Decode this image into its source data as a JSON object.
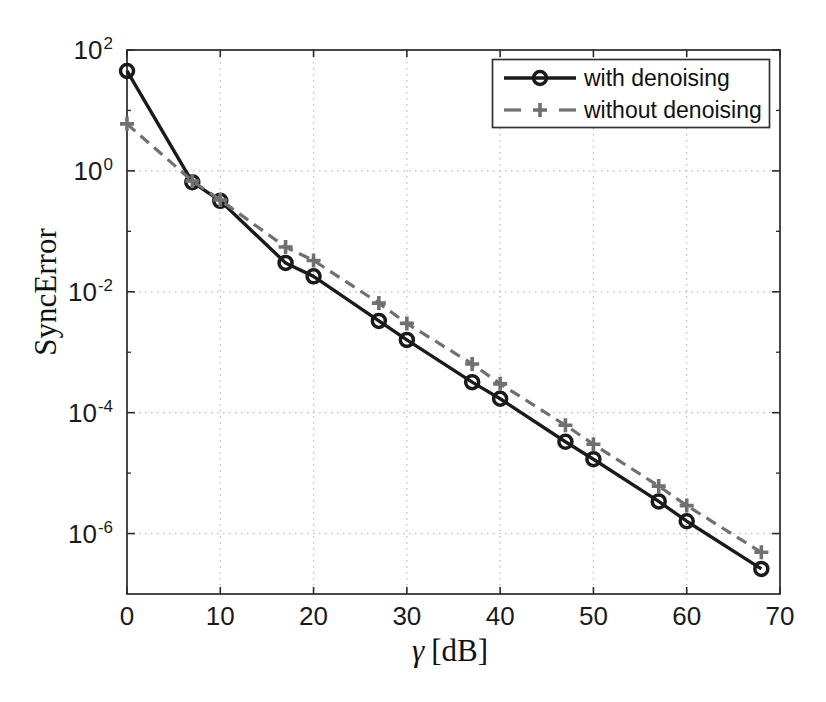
{
  "figure": {
    "background": "#ffffff",
    "axis_color": "#2a2a2a",
    "grid_color": "#bdbdbd",
    "text_color": "#1a1a1a"
  },
  "chart_data": {
    "type": "line",
    "title": "",
    "xlabel": "γ [dB]",
    "xlabel_symbol": "γ",
    "xlabel_unit": "[dB]",
    "ylabel": "SyncError",
    "x_axis": {
      "min": 0,
      "max": 70,
      "ticks": [
        0,
        10,
        20,
        30,
        40,
        50,
        60,
        70
      ]
    },
    "y_axis": {
      "scale": "log",
      "tick_base": "10",
      "min_exponent": -7,
      "max_exponent": 2,
      "labeled_tick_exponents": [
        2,
        0,
        -2,
        -4,
        -6
      ],
      "minor_tick_exponents": [
        1,
        -1,
        -3,
        -5
      ]
    },
    "grid": {
      "style": "dotted",
      "vertical_every_dB": 10,
      "horizontal_every_decades": 2
    },
    "legend": {
      "position": "top-right",
      "border_color": "#333333",
      "background": "#ffffff"
    },
    "x": [
      0,
      7,
      10,
      17,
      20,
      27,
      30,
      37,
      40,
      47,
      50,
      57,
      60,
      68
    ],
    "series": [
      {
        "name": "with denoising",
        "line": "solid",
        "marker": "circle",
        "color": "#1a1a1a",
        "values": [
          45,
          0.65,
          0.32,
          0.03,
          0.018,
          0.0033,
          0.0016,
          0.00032,
          0.00017,
          3.3e-05,
          1.7e-05,
          3.4e-06,
          1.6e-06,
          2.6e-07
        ]
      },
      {
        "name": "without denoising",
        "line": "dashed",
        "marker": "plus",
        "color": "#707070",
        "values": [
          6,
          0.68,
          0.33,
          0.055,
          0.033,
          0.0065,
          0.003,
          0.00064,
          0.0003,
          6.2e-05,
          3e-05,
          6.1e-06,
          2.9e-06,
          4.9e-07
        ]
      }
    ]
  }
}
